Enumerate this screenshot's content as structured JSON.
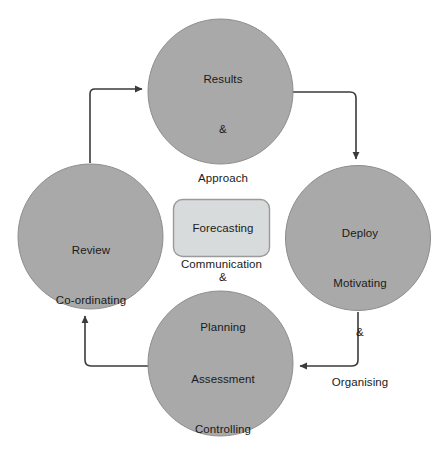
{
  "diagram": {
    "background_color": "#ffffff",
    "node_fill_color": "#a9a9a9",
    "node_stroke_color": "#8a8a8a",
    "center_fill_color": "#d8dbdb",
    "center_stroke_color": "#9a9a9a",
    "arrow_color": "#3b3b3b",
    "nodes": [
      {
        "id": "results",
        "shape": "circle",
        "lines": [
          "Results",
          "&",
          "Approach",
          "Forecasting",
          "&",
          "Planning"
        ]
      },
      {
        "id": "deploy",
        "shape": "circle",
        "lines": [
          "Deploy",
          "Motivating",
          "&",
          "Organising"
        ]
      },
      {
        "id": "assessment",
        "shape": "circle",
        "lines": [
          "Assessment",
          "Controlling"
        ]
      },
      {
        "id": "review",
        "shape": "circle",
        "lines": [
          "Review",
          "Co-ordinating"
        ]
      }
    ],
    "center_node": {
      "id": "communication",
      "shape": "rounded-rectangle",
      "label": "Communication"
    },
    "connections": [
      {
        "from": "review",
        "to": "results",
        "style": "elbow-arrow"
      },
      {
        "from": "results",
        "to": "deploy",
        "style": "elbow-arrow"
      },
      {
        "from": "deploy",
        "to": "assessment",
        "style": "elbow-arrow"
      },
      {
        "from": "assessment",
        "to": "review",
        "style": "elbow-arrow"
      }
    ]
  }
}
